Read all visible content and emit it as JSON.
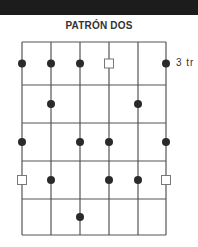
{
  "title": "PATRÓN DOS",
  "colors": {
    "header_bar": "#1c1c1c",
    "grid_line": "#555555",
    "dot": "#2a2a2a",
    "square_stroke": "#777777"
  },
  "grid": {
    "columns_x": [
      22,
      51,
      80,
      109,
      138,
      166
    ],
    "rows_y": [
      42,
      85,
      123,
      161,
      199,
      235
    ]
  },
  "fret_label": {
    "text": "3 tr",
    "row": 0
  },
  "markers": [
    {
      "row": 0,
      "col": 0,
      "type": "dot"
    },
    {
      "row": 0,
      "col": 1,
      "type": "dot"
    },
    {
      "row": 0,
      "col": 2,
      "type": "dot"
    },
    {
      "row": 0,
      "col": 3,
      "type": "square"
    },
    {
      "row": 0,
      "col": 5,
      "type": "dot"
    },
    {
      "row": 1,
      "col": 1,
      "type": "dot"
    },
    {
      "row": 1,
      "col": 4,
      "type": "dot"
    },
    {
      "row": 2,
      "col": 0,
      "type": "dot"
    },
    {
      "row": 2,
      "col": 2,
      "type": "dot"
    },
    {
      "row": 2,
      "col": 3,
      "type": "dot"
    },
    {
      "row": 2,
      "col": 5,
      "type": "dot"
    },
    {
      "row": 3,
      "col": 0,
      "type": "square"
    },
    {
      "row": 3,
      "col": 1,
      "type": "dot"
    },
    {
      "row": 3,
      "col": 3,
      "type": "dot"
    },
    {
      "row": 3,
      "col": 4,
      "type": "dot"
    },
    {
      "row": 3,
      "col": 5,
      "type": "square"
    },
    {
      "row": 4,
      "col": 2,
      "type": "dot"
    }
  ]
}
